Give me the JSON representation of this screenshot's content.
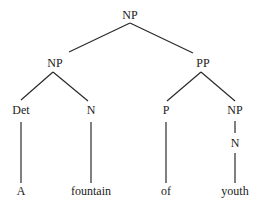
{
  "diagram": {
    "type": "syntax-tree",
    "line_color": "#2a2a2a",
    "text_color": "#1a1a1a",
    "nodes": {
      "root": {
        "label": "NP",
        "x": 130,
        "y": 15
      },
      "np_left": {
        "label": "NP",
        "x": 55,
        "y": 63
      },
      "pp": {
        "label": "PP",
        "x": 203,
        "y": 63
      },
      "det": {
        "label": "Det",
        "x": 21,
        "y": 110
      },
      "n_left": {
        "label": "N",
        "x": 91,
        "y": 110
      },
      "p": {
        "label": "P",
        "x": 166,
        "y": 110
      },
      "np_right": {
        "label": "NP",
        "x": 235,
        "y": 110
      },
      "n_right": {
        "label": "N",
        "x": 235,
        "y": 143
      },
      "leaf_a": {
        "label": "A",
        "x": 21,
        "y": 191
      },
      "leaf_fountain": {
        "label": "fountain",
        "x": 91,
        "y": 191
      },
      "leaf_of": {
        "label": "of",
        "x": 166,
        "y": 191
      },
      "leaf_youth": {
        "label": "youth",
        "x": 235,
        "y": 191
      }
    },
    "edges": [
      {
        "from": "root",
        "to": "np_left",
        "x1": 130,
        "y1": 23,
        "x2": 69,
        "y2": 52
      },
      {
        "from": "root",
        "to": "pp",
        "x1": 130,
        "y1": 23,
        "x2": 193,
        "y2": 53
      },
      {
        "from": "np_left",
        "to": "det",
        "x1": 53,
        "y1": 72,
        "x2": 21,
        "y2": 100
      },
      {
        "from": "np_left",
        "to": "n_left",
        "x1": 53,
        "y1": 72,
        "x2": 88,
        "y2": 101
      },
      {
        "from": "pp",
        "to": "p",
        "x1": 201,
        "y1": 72,
        "x2": 167,
        "y2": 101
      },
      {
        "from": "pp",
        "to": "np_right",
        "x1": 201,
        "y1": 72,
        "x2": 235,
        "y2": 101
      },
      {
        "from": "det",
        "to": "leaf_a",
        "x1": 21,
        "y1": 122,
        "x2": 21,
        "y2": 183
      },
      {
        "from": "n_left",
        "to": "leaf_fountain",
        "x1": 91,
        "y1": 122,
        "x2": 91,
        "y2": 183
      },
      {
        "from": "p",
        "to": "leaf_of",
        "x1": 166,
        "y1": 122,
        "x2": 166,
        "y2": 183
      },
      {
        "from": "np_right",
        "to": "n_right",
        "x1": 235,
        "y1": 121,
        "x2": 235,
        "y2": 133
      },
      {
        "from": "n_right",
        "to": "leaf_youth",
        "x1": 235,
        "y1": 153,
        "x2": 235,
        "y2": 183
      }
    ]
  }
}
